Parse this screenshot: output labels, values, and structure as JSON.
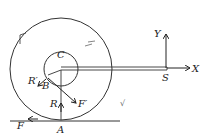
{
  "diagram": {
    "type": "mechanics-force-diagram",
    "labels": {
      "center": "C",
      "rod_end": "S",
      "x_axis": "X",
      "y_axis": "Y",
      "contact": "A",
      "axle_point": "B",
      "normal_reaction": "R",
      "axle_reaction": "R′",
      "ground_friction": "F",
      "axle_friction": "F′"
    },
    "marks": {
      "left_tick": "⌐",
      "right_tick": "⌐",
      "ground_mark": "√"
    },
    "colors": {
      "ink": "#222222",
      "background": "#ffffff"
    }
  }
}
